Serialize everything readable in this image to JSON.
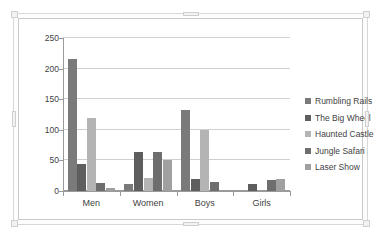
{
  "chart_data": {
    "type": "bar",
    "title": "",
    "subtitle": "",
    "xlabel": "",
    "ylabel": "",
    "categories": [
      "Men",
      "Women",
      "Boys",
      "Girls"
    ],
    "series": [
      {
        "name": "Rumbling Rails",
        "color": "#7a7a7a",
        "values": [
          216,
          12,
          132,
          0
        ]
      },
      {
        "name": "The Big Wheel",
        "color": "#5e5e5e",
        "values": [
          44,
          64,
          20,
          12
        ]
      },
      {
        "name": "Haunted Castle",
        "color": "#b4b4b4",
        "values": [
          120,
          22,
          100,
          0
        ]
      },
      {
        "name": "Jungle Safari",
        "color": "#6e6e6e",
        "values": [
          13,
          64,
          15,
          18
        ]
      },
      {
        "name": "Laser Show",
        "color": "#a0a0a0",
        "values": [
          5,
          51,
          0,
          19
        ]
      }
    ],
    "ylim": [
      0,
      250
    ],
    "yticks": [
      0,
      50,
      100,
      150,
      200,
      250
    ],
    "ytick_labels": [
      "0",
      "50",
      "100",
      "150",
      "200",
      "250"
    ],
    "grid": true,
    "grid_axis": "y",
    "legend_position": "right",
    "plot_background": "#ffffff",
    "gridline_color": "#d0d0d0",
    "axis_color": "#9a9a9a",
    "text_color": "#3f3f3f"
  },
  "chart_object": {
    "name": "embedded-chart",
    "selected": true,
    "frame_color": "#c9c9c9",
    "handle_color": "#f2f2f2"
  }
}
